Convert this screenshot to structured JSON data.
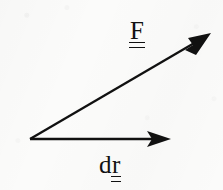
{
  "figure": {
    "name": "force-and-displacement-vector-diagram",
    "background_color": "#fbfbfa",
    "ink_color": "#111111",
    "width": 223,
    "height": 190
  },
  "labels": {
    "force": {
      "text": "F",
      "notation": "double-underline",
      "meaning": "force vector"
    },
    "displacement": {
      "prefix": "d",
      "text": "r",
      "notation": "double-underline",
      "meaning": "infinitesimal displacement vector"
    }
  },
  "vectors": [
    {
      "id": "force-vector",
      "label": "F",
      "origin": {
        "x": 30,
        "y": 139
      },
      "tip": {
        "x": 211,
        "y": 33
      },
      "stroke_width": 2.2,
      "arrowhead": "solid-triangle",
      "color": "#111111"
    },
    {
      "id": "displacement-vector",
      "label": "dr",
      "origin": {
        "x": 30,
        "y": 139
      },
      "tip": {
        "x": 171,
        "y": 139
      },
      "stroke_width": 2.2,
      "arrowhead": "solid-triangle",
      "color": "#111111"
    }
  ]
}
